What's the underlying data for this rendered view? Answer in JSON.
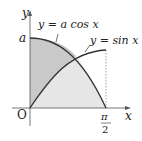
{
  "diagram": {
    "labels": {
      "y_axis": "y",
      "x_axis": "x",
      "origin": "O",
      "a": "a",
      "pi": "π",
      "two": "2",
      "cos_label": "y = a cos x",
      "sin_label": "y = sin x"
    },
    "colors": {
      "dark_fill": "#c8c8c8",
      "light_fill": "#e6e6e6",
      "curve": "#333333",
      "axis": "#555555"
    }
  }
}
